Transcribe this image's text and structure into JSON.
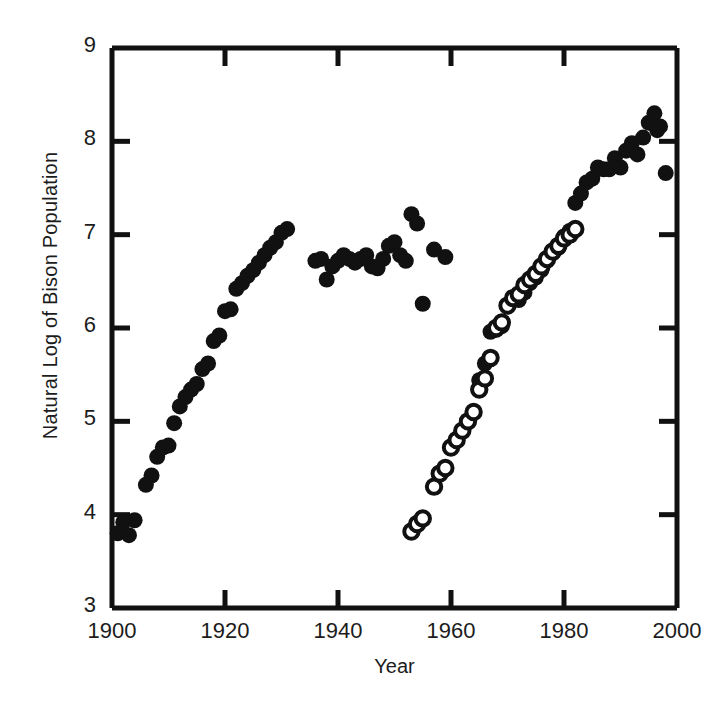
{
  "chart_data": {
    "type": "scatter",
    "title": "",
    "xlabel": "Year",
    "ylabel": "Natural Log of Bison Population",
    "xlim": [
      1900,
      2000
    ],
    "ylim": [
      3,
      9
    ],
    "xticks": [
      1900,
      1920,
      1940,
      1960,
      1980,
      2000
    ],
    "yticks": [
      3,
      4,
      5,
      6,
      7,
      8,
      9
    ],
    "xtick_labels": [
      "1900",
      "1920",
      "1940",
      "1960",
      "1980",
      "2000"
    ],
    "ytick_labels": [
      "3",
      "4",
      "5",
      "6",
      "7",
      "8",
      "9"
    ],
    "grid": false,
    "legend": "none",
    "marker_colors": {
      "filled": "#111111",
      "open_stroke": "#111111",
      "open_fill": "#ffffff"
    },
    "axis_color": "#111111",
    "background": "#ffffff",
    "series": [
      {
        "name": "filled-circles",
        "marker": "filled-circle",
        "points": [
          [
            1901,
            3.8
          ],
          [
            1902,
            3.92
          ],
          [
            1903,
            3.78
          ],
          [
            1904,
            3.94
          ],
          [
            1906,
            4.32
          ],
          [
            1907,
            4.42
          ],
          [
            1908,
            4.62
          ],
          [
            1909,
            4.72
          ],
          [
            1910,
            4.74
          ],
          [
            1911,
            4.98
          ],
          [
            1912,
            5.16
          ],
          [
            1913,
            5.26
          ],
          [
            1914,
            5.34
          ],
          [
            1915,
            5.4
          ],
          [
            1916,
            5.56
          ],
          [
            1917,
            5.62
          ],
          [
            1918,
            5.86
          ],
          [
            1919,
            5.92
          ],
          [
            1920,
            6.18
          ],
          [
            1921,
            6.2
          ],
          [
            1922,
            6.42
          ],
          [
            1923,
            6.48
          ],
          [
            1924,
            6.56
          ],
          [
            1925,
            6.62
          ],
          [
            1926,
            6.7
          ],
          [
            1927,
            6.78
          ],
          [
            1928,
            6.86
          ],
          [
            1929,
            6.92
          ],
          [
            1930,
            7.02
          ],
          [
            1931,
            7.06
          ],
          [
            1936,
            6.72
          ],
          [
            1937,
            6.74
          ],
          [
            1938,
            6.52
          ],
          [
            1939,
            6.66
          ],
          [
            1940,
            6.72
          ],
          [
            1941,
            6.78
          ],
          [
            1942,
            6.74
          ],
          [
            1943,
            6.7
          ],
          [
            1944,
            6.74
          ],
          [
            1945,
            6.78
          ],
          [
            1946,
            6.66
          ],
          [
            1947,
            6.64
          ],
          [
            1948,
            6.74
          ],
          [
            1949,
            6.88
          ],
          [
            1950,
            6.92
          ],
          [
            1951,
            6.78
          ],
          [
            1952,
            6.72
          ],
          [
            1953,
            7.22
          ],
          [
            1954,
            7.12
          ],
          [
            1955,
            6.26
          ],
          [
            1957,
            6.84
          ],
          [
            1959,
            6.76
          ],
          [
            1965,
            5.44
          ],
          [
            1966,
            5.62
          ],
          [
            1967,
            5.96
          ],
          [
            1968,
            5.98
          ],
          [
            1969,
            6.02
          ],
          [
            1970,
            6.24
          ],
          [
            1971,
            6.32
          ],
          [
            1972,
            6.3
          ],
          [
            1973,
            6.38
          ],
          [
            1974,
            6.48
          ],
          [
            1975,
            6.54
          ],
          [
            1976,
            6.62
          ],
          [
            1977,
            6.72
          ],
          [
            1978,
            6.8
          ],
          [
            1979,
            6.86
          ],
          [
            1980,
            6.98
          ],
          [
            1981,
            7.04
          ],
          [
            1982,
            7.34
          ],
          [
            1983,
            7.44
          ],
          [
            1984,
            7.56
          ],
          [
            1985,
            7.6
          ],
          [
            1986,
            7.72
          ],
          [
            1987,
            7.7
          ],
          [
            1988,
            7.7
          ],
          [
            1989,
            7.82
          ],
          [
            1990,
            7.72
          ],
          [
            1991,
            7.9
          ],
          [
            1992,
            7.98
          ],
          [
            1993,
            7.86
          ],
          [
            1994,
            8.04
          ],
          [
            1995,
            8.2
          ],
          [
            1996,
            8.3
          ],
          [
            1996.5,
            8.12
          ],
          [
            1997,
            8.16
          ],
          [
            1998,
            7.66
          ]
        ]
      },
      {
        "name": "open-circles",
        "marker": "open-circle",
        "points": [
          [
            1953,
            3.82
          ],
          [
            1954,
            3.9
          ],
          [
            1955,
            3.96
          ],
          [
            1957,
            4.3
          ],
          [
            1958,
            4.44
          ],
          [
            1959,
            4.5
          ],
          [
            1960,
            4.72
          ],
          [
            1961,
            4.8
          ],
          [
            1962,
            4.9
          ],
          [
            1963,
            5.0
          ],
          [
            1964,
            5.1
          ],
          [
            1965,
            5.34
          ],
          [
            1966,
            5.46
          ],
          [
            1967,
            5.68
          ],
          [
            1968,
            6.0
          ],
          [
            1969,
            6.06
          ],
          [
            1970,
            6.24
          ],
          [
            1971,
            6.32
          ],
          [
            1972,
            6.36
          ],
          [
            1973,
            6.46
          ],
          [
            1974,
            6.52
          ],
          [
            1975,
            6.58
          ],
          [
            1976,
            6.66
          ],
          [
            1977,
            6.74
          ],
          [
            1978,
            6.82
          ],
          [
            1979,
            6.88
          ],
          [
            1980,
            6.96
          ],
          [
            1981,
            7.0
          ],
          [
            1982,
            7.06
          ]
        ]
      }
    ]
  },
  "axes": {
    "x_label": "Year",
    "y_label": "Natural Log of Bison Population"
  }
}
